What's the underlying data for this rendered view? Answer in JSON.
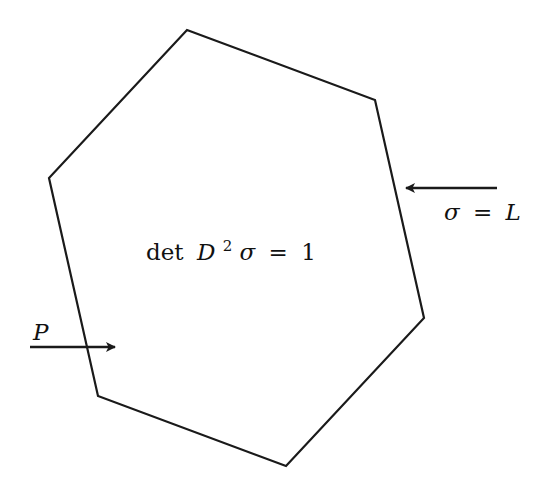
{
  "diagram": {
    "type": "hexagon-domain",
    "stroke_color": "#1a1a1a",
    "background": "#ffffff",
    "hexagon": {
      "vertices": [
        [
          187,
          30
        ],
        [
          375,
          100
        ],
        [
          424,
          318
        ],
        [
          286,
          466
        ],
        [
          98,
          396
        ],
        [
          49,
          178
        ]
      ]
    },
    "center_label": {
      "op": "det",
      "var": "D",
      "sup": "2",
      "sigma": "σ",
      "eq": "=",
      "rhs": "1"
    },
    "boundary_label": {
      "sigma": "σ",
      "eq": "=",
      "rhs": "L"
    },
    "point_label": {
      "text": "P"
    },
    "arrows": [
      {
        "name": "boundary-arrow",
        "from": [
          497,
          188
        ],
        "to": [
          404,
          188
        ]
      },
      {
        "name": "point-arrow",
        "from": [
          30,
          347
        ],
        "to": [
          115,
          347
        ]
      }
    ]
  }
}
